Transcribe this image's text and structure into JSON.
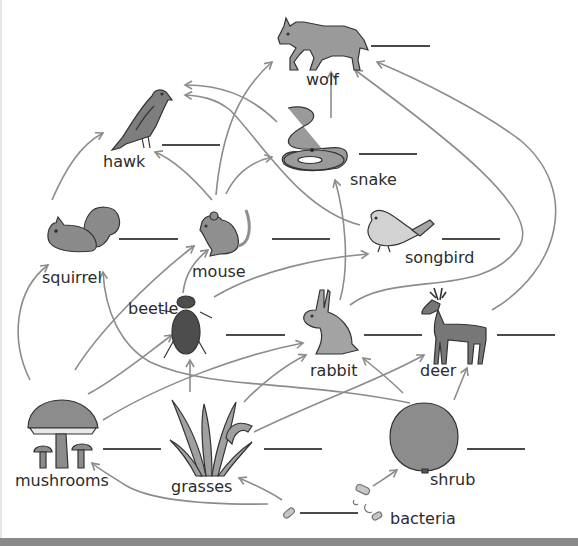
{
  "colors": {
    "arrow": "#8c8c8c",
    "organism_fill": "#8f8f8f",
    "organism_dark": "#5a5a5a",
    "organism_light": "#c9c9c9",
    "outline": "#333333",
    "blank_line": "#4a4a4a",
    "text": "#2b2b2b"
  },
  "organisms": [
    {
      "id": "wolf",
      "label": "wolf",
      "icon": "wolf-icon"
    },
    {
      "id": "hawk",
      "label": "hawk",
      "icon": "hawk-icon"
    },
    {
      "id": "snake",
      "label": "snake",
      "icon": "snake-icon"
    },
    {
      "id": "squirrel",
      "label": "squirrel",
      "icon": "squirrel-icon"
    },
    {
      "id": "mouse",
      "label": "mouse",
      "icon": "mouse-icon"
    },
    {
      "id": "songbird",
      "label": "songbird",
      "icon": "songbird-icon"
    },
    {
      "id": "beetle",
      "label": "beetle",
      "icon": "beetle-icon"
    },
    {
      "id": "rabbit",
      "label": "rabbit",
      "icon": "rabbit-icon"
    },
    {
      "id": "deer",
      "label": "deer",
      "icon": "deer-icon"
    },
    {
      "id": "mushrooms",
      "label": "mushrooms",
      "icon": "mushroom-icon"
    },
    {
      "id": "grasses",
      "label": "grasses",
      "icon": "grass-icon"
    },
    {
      "id": "shrub",
      "label": "shrub",
      "icon": "shrub-icon"
    },
    {
      "id": "bacteria",
      "label": "bacteria",
      "icon": "bacteria-icon"
    }
  ],
  "blanks": [
    {
      "for": "wolf",
      "value": ""
    },
    {
      "for": "hawk",
      "value": ""
    },
    {
      "for": "snake",
      "value": ""
    },
    {
      "for": "squirrel",
      "value": ""
    },
    {
      "for": "mouse",
      "value": ""
    },
    {
      "for": "songbird",
      "value": ""
    },
    {
      "for": "beetle",
      "value": ""
    },
    {
      "for": "rabbit",
      "value": ""
    },
    {
      "for": "deer",
      "value": ""
    },
    {
      "for": "mushrooms",
      "value": ""
    },
    {
      "for": "grasses",
      "value": ""
    },
    {
      "for": "shrub",
      "value": ""
    },
    {
      "for": "bacteria",
      "value": ""
    }
  ],
  "edges": [
    {
      "from": "snake",
      "to": "wolf"
    },
    {
      "from": "mouse",
      "to": "wolf"
    },
    {
      "from": "rabbit",
      "to": "wolf"
    },
    {
      "from": "deer",
      "to": "wolf"
    },
    {
      "from": "snake",
      "to": "hawk"
    },
    {
      "from": "songbird",
      "to": "hawk"
    },
    {
      "from": "mouse",
      "to": "hawk"
    },
    {
      "from": "squirrel",
      "to": "hawk"
    },
    {
      "from": "mouse",
      "to": "snake"
    },
    {
      "from": "rabbit",
      "to": "snake"
    },
    {
      "from": "beetle",
      "to": "mouse"
    },
    {
      "from": "mushrooms",
      "to": "mouse"
    },
    {
      "from": "beetle",
      "to": "songbird"
    },
    {
      "from": "mushrooms",
      "to": "squirrel"
    },
    {
      "from": "shrub",
      "to": "squirrel"
    },
    {
      "from": "mushrooms",
      "to": "beetle"
    },
    {
      "from": "grasses",
      "to": "beetle"
    },
    {
      "from": "mushrooms",
      "to": "rabbit"
    },
    {
      "from": "grasses",
      "to": "rabbit"
    },
    {
      "from": "shrub",
      "to": "rabbit"
    },
    {
      "from": "grasses",
      "to": "deer"
    },
    {
      "from": "shrub",
      "to": "deer"
    },
    {
      "from": "bacteria",
      "to": "grasses"
    },
    {
      "from": "bacteria",
      "to": "mushrooms"
    },
    {
      "from": "bacteria",
      "to": "shrub"
    }
  ]
}
